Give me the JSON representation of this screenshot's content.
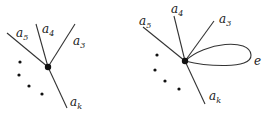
{
  "diagrams": [
    {
      "name": "vertex-without-loop",
      "labels": [
        {
          "base": "a",
          "sub": "5"
        },
        {
          "base": "a",
          "sub": "4"
        },
        {
          "base": "a",
          "sub": "3"
        },
        {
          "base": "a",
          "sub": "k"
        }
      ]
    },
    {
      "name": "vertex-with-loop",
      "labels": [
        {
          "base": "a",
          "sub": "5"
        },
        {
          "base": "a",
          "sub": "4"
        },
        {
          "base": "a",
          "sub": "3"
        },
        {
          "base": "a",
          "sub": "k"
        }
      ],
      "loop_label": "e"
    }
  ],
  "colors": {
    "stroke": "#333333",
    "background": "#ffffff"
  }
}
